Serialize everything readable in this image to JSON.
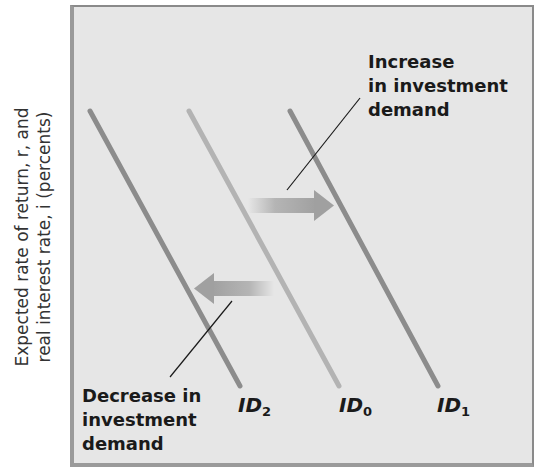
{
  "axis": {
    "ylabel_line1": "Expected rate of return, r, and",
    "ylabel_line2": "real interest rate, i (percents)"
  },
  "curves": [
    {
      "id": "ID2",
      "label": "ID",
      "subscript": "2",
      "color": "#8c8c8c"
    },
    {
      "id": "ID0",
      "label": "ID",
      "subscript": "0",
      "color": "#b3b3b3"
    },
    {
      "id": "ID1",
      "label": "ID",
      "subscript": "1",
      "color": "#8c8c8c"
    }
  ],
  "annotations": {
    "increase": {
      "line1": "Increase",
      "line2": "in investment",
      "line3": "demand"
    },
    "decrease": {
      "line1": "Decrease in",
      "line2": "investment",
      "line3": "demand"
    }
  },
  "colors": {
    "background": "#e6e6e6",
    "frame": "#9a9a9a",
    "arrow": "#a8a8a8"
  }
}
